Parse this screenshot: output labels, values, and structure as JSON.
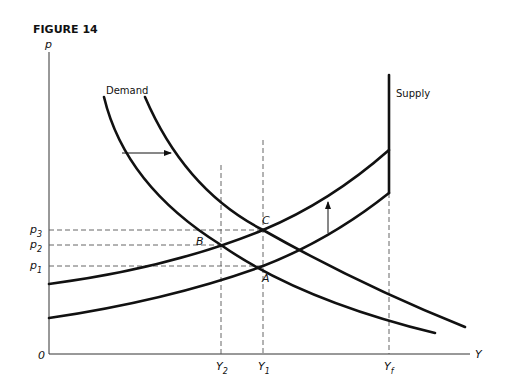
{
  "figure": {
    "title": "FIGURE 14",
    "axes": {
      "y_label": "p",
      "x_label": "Y",
      "origin_label": "0"
    },
    "curve_labels": {
      "demand": "Demand",
      "supply": "Supply"
    },
    "price_levels": [
      {
        "base": "p",
        "sub": "3"
      },
      {
        "base": "p",
        "sub": "2"
      },
      {
        "base": "p",
        "sub": "1"
      }
    ],
    "output_levels": [
      {
        "base": "Y",
        "sub": "2"
      },
      {
        "base": "Y",
        "sub": "1"
      },
      {
        "base": "Y",
        "sub": "f"
      }
    ],
    "points": {
      "A": "A",
      "B": "B",
      "C": "C"
    },
    "colors": {
      "ink": "#111111",
      "dash": "#555555",
      "background": "#ffffff"
    }
  }
}
